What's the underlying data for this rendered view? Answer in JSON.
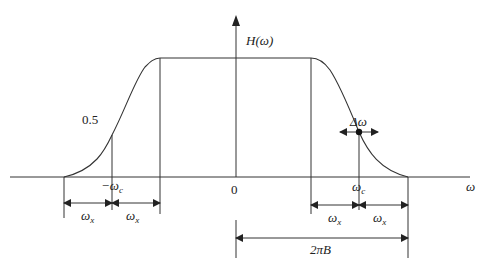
{
  "diagram": {
    "y_axis_label": "H(ω)",
    "x_axis_label": "ω",
    "origin_label": "0",
    "half_level_label": "0.5",
    "neg_cutoff": {
      "main": "−ω",
      "sub": "c"
    },
    "pos_cutoff": {
      "main": "ω",
      "sub": "c"
    },
    "delta_label": "Δω",
    "left_dims": [
      {
        "main": "ω",
        "sub": "x"
      },
      {
        "main": "ω",
        "sub": "x"
      }
    ],
    "right_dims": [
      {
        "main": "ω",
        "sub": "x"
      },
      {
        "main": "ω",
        "sub": "x"
      }
    ],
    "bandwidth_label": "2πB",
    "colors": {
      "line": "#333333",
      "background": "#ffffff"
    }
  }
}
